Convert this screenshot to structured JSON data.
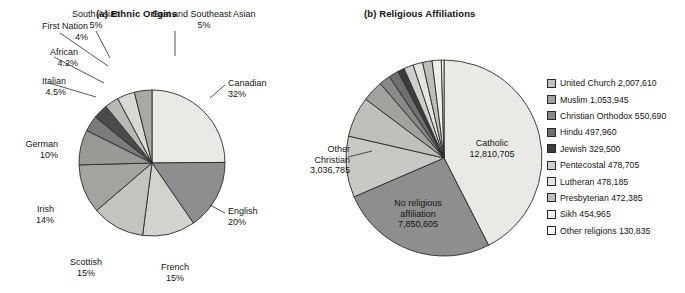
{
  "figure": {
    "background": "#ffffff",
    "line_color": "#2a2a2a"
  },
  "chart_data": [
    {
      "type": "pie",
      "id": "ethnic-origins",
      "title": "(a) Ethnic Origins",
      "value_suffix": "%",
      "legend": "none",
      "labels_outside": true,
      "categories": [
        "Canadian",
        "English",
        "French",
        "Scottish",
        "Irish",
        "German",
        "Italian",
        "African",
        "First Nation",
        "South Asian",
        "East and Southeast Asian"
      ],
      "values": [
        32,
        20,
        15,
        15,
        14,
        10,
        4.5,
        4.2,
        4,
        5,
        5
      ],
      "value_labels": [
        "32%",
        "20%",
        "15%",
        "15%",
        "14%",
        "10%",
        "4.5%",
        "4.2%",
        "4%",
        "5%",
        "5%"
      ],
      "colors": [
        "#eceae6",
        "#8d8d8d",
        "#d3d1cd",
        "#c6c4c0",
        "#a8a6a2",
        "#9c9a96",
        "#7a7a7a",
        "#4a4a4a",
        "#b9b7b3",
        "#d8d6d2",
        "#a9a7a3"
      ],
      "start_angle_deg": -90
    },
    {
      "type": "pie",
      "id": "religious-affiliations",
      "title": "(b) Religious Affiliations",
      "legend": "right",
      "labels_outside": true,
      "categories": [
        "Catholic",
        "No religious affiliation",
        "Other Christian",
        "United Church",
        "Muslim",
        "Christian Orthodox",
        "Hindu",
        "Jewish",
        "Pentecostal",
        "Lutheran",
        "Presbyterian",
        "Sikh",
        "Other religions"
      ],
      "values": [
        12810705,
        7850605,
        3036785,
        2007610,
        1053945,
        550690,
        497960,
        329500,
        478705,
        478185,
        472385,
        454965,
        130835
      ],
      "value_labels": [
        "12,810,705",
        "7,850,605",
        "3,036,785",
        "2,007,610",
        "1,053,945",
        "550,690",
        "497,960",
        "329,500",
        "478,705",
        "478,185",
        "472,385",
        "454,965",
        "130,835"
      ],
      "colors": [
        "#eceae6",
        "#8d8d8d",
        "#c9c7c3",
        "#c0bebа",
        "#a2a09c",
        "#8a8886",
        "#6e6e6e",
        "#3c3c3c",
        "#d0cecа",
        "#e4e2de",
        "#bdbbb7",
        "#efedea",
        "#f6f4f1"
      ],
      "start_angle_deg": -90
    }
  ],
  "chart_a": {
    "title": "(a) Ethnic Origins",
    "slices": [
      {
        "name": "Canadian",
        "pct": "32%",
        "value": 32,
        "color": "#ebe9e5"
      },
      {
        "name": "English",
        "pct": "20%",
        "value": 20,
        "color": "#8e8e8e"
      },
      {
        "name": "French",
        "pct": "15%",
        "value": 15,
        "color": "#d4d2ce"
      },
      {
        "name": "Scottish",
        "pct": "15%",
        "value": 15,
        "color": "#c5c3bf"
      },
      {
        "name": "Irish",
        "pct": "14%",
        "value": 14,
        "color": "#a5a39f"
      },
      {
        "name": "German",
        "pct": "10%",
        "value": 10,
        "color": "#9b9995"
      },
      {
        "name": "Italian",
        "pct": "4.5%",
        "value": 4.5,
        "color": "#7b7b7b"
      },
      {
        "name": "African",
        "pct": "4.2%",
        "value": 4.2,
        "color": "#4b4b4b"
      },
      {
        "name": "First Nation",
        "pct": "4%",
        "value": 4,
        "color": "#bab8b4"
      },
      {
        "name": "South Asian",
        "pct": "5%",
        "value": 5,
        "color": "#dad8d4"
      },
      {
        "name": "East and Southeast Asian",
        "pct": "5%",
        "value": 5,
        "color": "#aaa8a4"
      }
    ]
  },
  "chart_b": {
    "title": "(b) Religious Affiliations",
    "callouts": [
      {
        "name": "Catholic",
        "value": "12,810,705"
      },
      {
        "name_line1": "No religious",
        "name_line2": "affiliation",
        "value": "7,850,605"
      },
      {
        "name_line1": "Other",
        "name_line2": "Christian",
        "value": "3,036,785"
      }
    ],
    "legend_items": [
      {
        "label": "United Church 2,007,610",
        "color": "#c3c1bd"
      },
      {
        "label": "Muslim 1,053,945",
        "color": "#a3a19d"
      },
      {
        "label": "Christian Orthodox 550,690",
        "color": "#8b8987"
      },
      {
        "label": "Hindu 497,960",
        "color": "#6f6f6f"
      },
      {
        "label": "Jewish 329,500",
        "color": "#3d3d3d"
      },
      {
        "label": "Pentecostal 478,705",
        "color": "#d1cfcb"
      },
      {
        "label": "Lutheran 478,185",
        "color": "#e6e4e0"
      },
      {
        "label": "Presbyterian 472,385",
        "color": "#bfbdb9"
      },
      {
        "label": "Sikh 454,965",
        "color": "#f0eeeb"
      },
      {
        "label": "Other religions 130,835",
        "color": "#f8f6f3"
      }
    ]
  }
}
